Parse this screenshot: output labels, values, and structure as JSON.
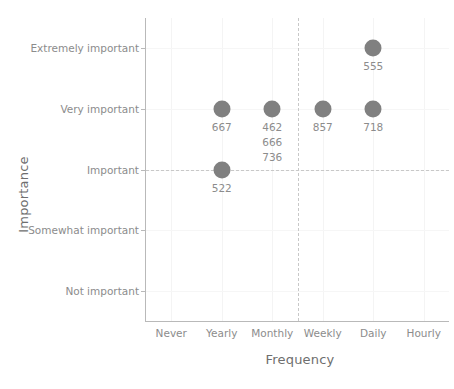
{
  "chart_data": {
    "type": "scatter",
    "title": "",
    "xlabel": "Frequency",
    "ylabel": "Importance",
    "grid": true,
    "legend": null,
    "x_categories": [
      "Never",
      "Yearly",
      "Monthly",
      "Weekly",
      "Daily",
      "Hourly"
    ],
    "y_categories": [
      "Not important",
      "Somewhat important",
      "Important",
      "Very important",
      "Extremely important"
    ],
    "marker_color": "#808080",
    "label_color": "#8c8c8c",
    "axis_color": "#b9b9b9",
    "refline_color": "#c8c8c8",
    "reference_lines": {
      "horizontal": "Important",
      "vertical_between": [
        "Monthly",
        "Weekly"
      ]
    },
    "points": [
      {
        "x": "Yearly",
        "y": "Very important",
        "labels": [
          "667"
        ]
      },
      {
        "x": "Yearly",
        "y": "Important",
        "labels": [
          "522"
        ]
      },
      {
        "x": "Monthly",
        "y": "Very important",
        "labels": [
          "462",
          "666",
          "736"
        ]
      },
      {
        "x": "Weekly",
        "y": "Very important",
        "labels": [
          "857"
        ]
      },
      {
        "x": "Daily",
        "y": "Very important",
        "labels": [
          "718"
        ]
      },
      {
        "x": "Daily",
        "y": "Extremely important",
        "labels": [
          "555"
        ]
      }
    ]
  }
}
